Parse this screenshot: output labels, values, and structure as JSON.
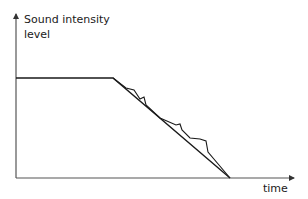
{
  "chart_data": {
    "type": "line",
    "title": "",
    "xlabel": "time",
    "ylabel_lines": [
      "Sound intensity",
      "level"
    ],
    "grid": false,
    "legend": null,
    "series": [
      {
        "name": "idealized decay",
        "description": "constant level, then linear decay to zero",
        "points_px": [
          [
            16,
            78
          ],
          [
            113,
            78
          ],
          [
            230,
            178
          ]
        ]
      },
      {
        "name": "actual decay with reflections",
        "description": "follows the linear decay with small bumps/peaks",
        "points_px": [
          [
            113,
            78
          ],
          [
            126,
            88
          ],
          [
            134,
            90
          ],
          [
            140,
            99
          ],
          [
            144,
            97
          ],
          [
            146,
            105
          ],
          [
            160,
            118
          ],
          [
            176,
            125
          ],
          [
            180,
            124
          ],
          [
            182,
            130
          ],
          [
            190,
            138
          ],
          [
            200,
            139
          ],
          [
            206,
            141
          ],
          [
            208,
            152
          ],
          [
            230,
            178
          ]
        ]
      }
    ],
    "axes": {
      "origin_px": [
        16,
        178
      ],
      "y_axis_top_px": [
        16,
        14
      ],
      "x_axis_end_px": [
        294,
        178
      ]
    }
  },
  "labels": {
    "y_line1": "Sound intensity",
    "y_line2": "level",
    "x": "time"
  },
  "colors": {
    "line": "#1a1a1a",
    "axis": "#555555",
    "background": "#ffffff"
  }
}
